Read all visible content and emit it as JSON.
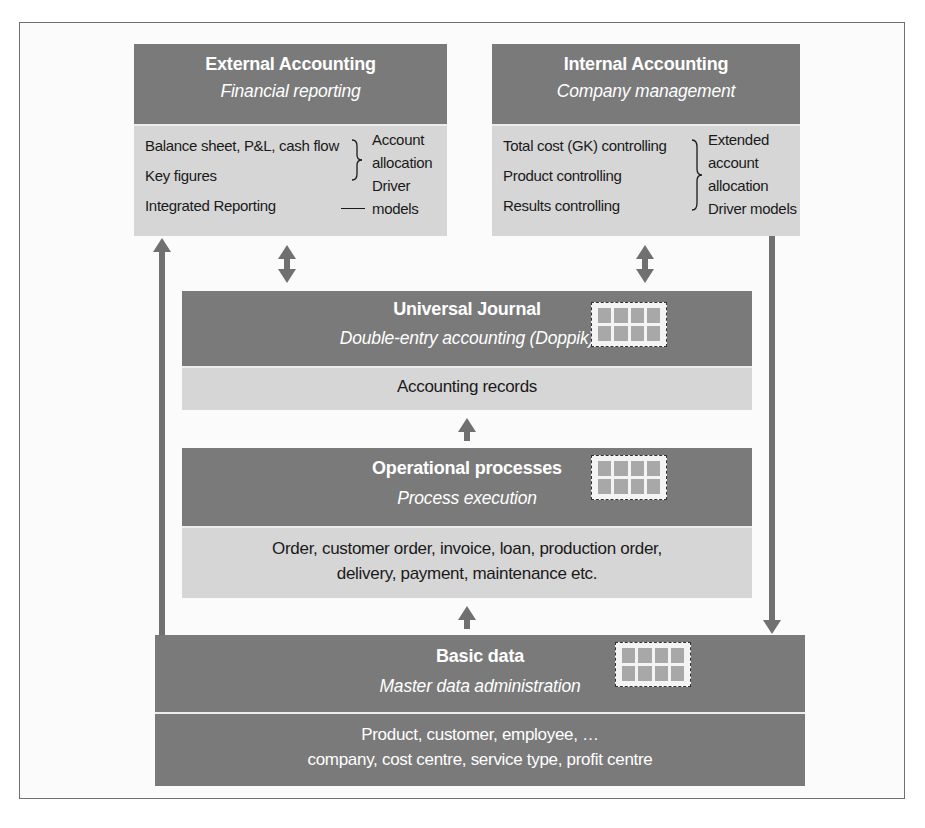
{
  "external": {
    "title": "External Accounting",
    "subtitle": "Financial reporting",
    "items": [
      "Balance sheet, P&L, cash flow",
      "Key figures",
      "Integrated Reporting"
    ],
    "notes": [
      "Account",
      "allocation",
      "Driver",
      "models"
    ]
  },
  "internal": {
    "title": "Internal Accounting",
    "subtitle": "Company management",
    "items": [
      "Total cost (GK) controlling",
      "Product controlling",
      "Results controlling"
    ],
    "notes": [
      "Extended",
      "account",
      "allocation",
      "Driver models"
    ]
  },
  "universal_journal": {
    "title": "Universal Journal",
    "subtitle": "Double-entry accounting (Doppik)",
    "body": [
      "Accounting records"
    ],
    "icon": "table-grid-icon"
  },
  "operational": {
    "title": "Operational processes",
    "subtitle": "Process execution",
    "body": [
      "Order, customer order, invoice, loan, production order,",
      "delivery, payment, maintenance etc."
    ],
    "icon": "table-grid-icon"
  },
  "basic_data": {
    "title": "Basic data",
    "subtitle": "Master data administration",
    "body": [
      "Product, customer, employee, …",
      "company, cost centre, service type, profit centre"
    ],
    "icon": "table-grid-icon"
  },
  "colors": {
    "header_bg": "#7a7a7a",
    "body_light_bg": "#d6d6d6",
    "arrow": "#707070",
    "text_dark": "#1a1a1a",
    "text_light": "#ffffff"
  }
}
